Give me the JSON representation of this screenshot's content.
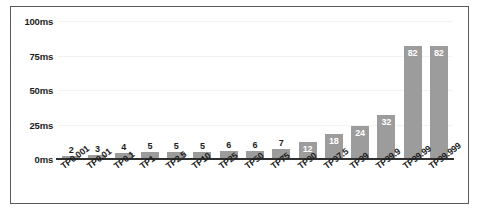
{
  "chart_data": {
    "type": "bar",
    "title": "",
    "subtitle": "",
    "xlabel": "",
    "ylabel": "",
    "ylim": [
      0,
      100
    ],
    "y_unit": "ms",
    "grid": true,
    "legend": "none",
    "y_ticks": [
      "0ms",
      "25ms",
      "50ms",
      "75ms",
      "100ms"
    ],
    "y_tick_values": [
      0,
      25,
      50,
      75,
      100
    ],
    "categories": [
      "TP0.001",
      "TP0.01",
      "TP0.1",
      "TP1",
      "TP2.5",
      "TP10",
      "TP25",
      "TP50",
      "TP75",
      "TP90",
      "TP97.5",
      "TP99",
      "TP99.9",
      "TP99.99",
      "TP99.999"
    ],
    "values": [
      2,
      3,
      4,
      5,
      5,
      5,
      6,
      6,
      7,
      12,
      18,
      24,
      32,
      82,
      82
    ],
    "value_labels": [
      "2",
      "3",
      "4",
      "5",
      "5",
      "5",
      "6",
      "6",
      "7",
      "12",
      "18",
      "24",
      "32",
      "82",
      "82"
    ],
    "label_placement": [
      "above",
      "above",
      "above",
      "above",
      "above",
      "above",
      "above",
      "above",
      "above",
      "inside",
      "inside",
      "inside",
      "inside",
      "inside",
      "inside"
    ],
    "colors": {
      "bar": "#9c9c9c",
      "axis": "#2f2f2f",
      "grid": "#f2f2f2",
      "frame": "#5a5a5a",
      "background": "#ffffff",
      "label_outside": "#1d1d1d",
      "label_inside": "#ffffff"
    }
  }
}
